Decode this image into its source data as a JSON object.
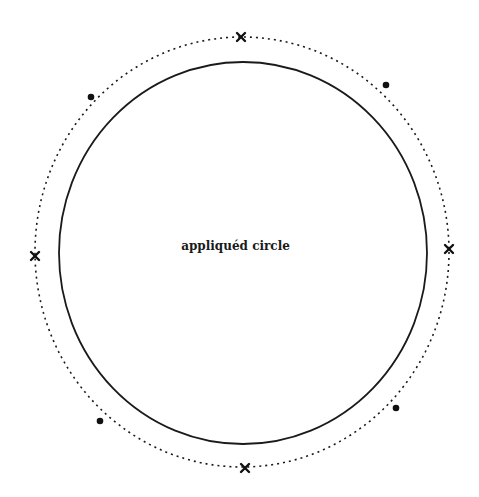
{
  "diagram": {
    "center_label": "appliquéd circle",
    "inner_circle": {
      "cx": 243,
      "cy": 253,
      "rx": 184,
      "ry": 191,
      "stroke": "#1a1a1a",
      "style": "solid"
    },
    "outer_circle": {
      "cx": 242,
      "cy": 252,
      "rx": 207,
      "ry": 215,
      "stroke": "#1a1a1a",
      "style": "dotted"
    },
    "cross_markers": [
      {
        "position": "top",
        "x": 241,
        "y": 37
      },
      {
        "position": "right",
        "x": 449,
        "y": 249
      },
      {
        "position": "bottom",
        "x": 245,
        "y": 468
      },
      {
        "position": "left",
        "x": 35,
        "y": 256
      }
    ],
    "dot_markers": [
      {
        "position": "top-left",
        "x": 91,
        "y": 97
      },
      {
        "position": "top-right",
        "x": 386,
        "y": 85
      },
      {
        "position": "bottom-right",
        "x": 396,
        "y": 408
      },
      {
        "position": "bottom-left",
        "x": 100,
        "y": 421
      }
    ]
  }
}
